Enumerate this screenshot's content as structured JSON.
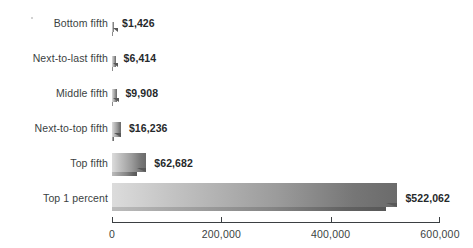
{
  "chart_data": {
    "type": "bar",
    "orientation": "horizontal",
    "title": "",
    "xlabel": "",
    "ylabel": "",
    "categories": [
      "Bottom fifth",
      "Next-to-last fifth",
      "Middle fifth",
      "Next-to-top fifth",
      "Top fifth",
      "Top 1 percent"
    ],
    "values": [
      1426,
      6414,
      9908,
      16236,
      62682,
      522062
    ],
    "value_labels": [
      "$1,426",
      "$6,414",
      "$9,908",
      "$16,236",
      "$62,682",
      "$522,062"
    ],
    "xlim": [
      0,
      600000
    ],
    "xticks": [
      0,
      200000,
      400000,
      600000
    ],
    "xtick_labels": [
      "0",
      "200,000",
      "400,000",
      "600,000"
    ],
    "grid": false,
    "legend": null,
    "bar_style": "3d-extruded-gradient",
    "colors": {
      "background": "#ffffff",
      "bar_gradient_start": "#dcdcdc",
      "bar_gradient_end": "#6b6b6b",
      "axis": "#3b3f42",
      "category_label": "#3b3f42",
      "value_label": "#26292b"
    }
  },
  "axis": {
    "ticks": [
      {
        "label": "0",
        "value": 0
      },
      {
        "label": "200,000",
        "value": 200000
      },
      {
        "label": "400,000",
        "value": 400000
      },
      {
        "label": "600,000",
        "value": 600000
      }
    ]
  },
  "rows": [
    {
      "category": "Bottom fifth",
      "value": 1426,
      "value_label": "$1,426"
    },
    {
      "category": "Next-to-last fifth",
      "value": 6414,
      "value_label": "$6,414"
    },
    {
      "category": "Middle fifth",
      "value": 9908,
      "value_label": "$9,908"
    },
    {
      "category": "Next-to-top fifth",
      "value": 16236,
      "value_label": "$16,236"
    },
    {
      "category": "Top fifth",
      "value": 62682,
      "value_label": "$62,682"
    },
    {
      "category": "Top 1 percent",
      "value": 522062,
      "value_label": "$522,062"
    }
  ],
  "title_remnant": ""
}
